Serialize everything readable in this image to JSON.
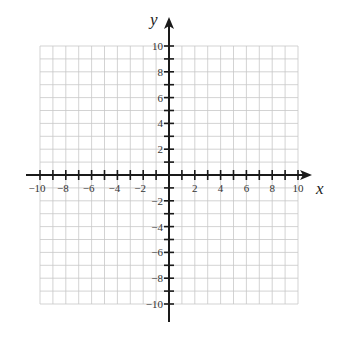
{
  "graph": {
    "title": "Coordinate plane",
    "x_axis": {
      "label": "x",
      "min": -10,
      "max": 10,
      "tick_step": 1,
      "label_step": 2
    },
    "y_axis": {
      "label": "y",
      "min": -10,
      "max": 10,
      "tick_step": 1,
      "label_step": 2
    },
    "x_tick_labels": [
      "-10",
      "-8",
      "-6",
      "-4",
      "-2",
      "2",
      "4",
      "6",
      "8",
      "10"
    ],
    "y_tick_labels": [
      "10",
      "8",
      "6",
      "4",
      "2",
      "-2",
      "-4",
      "-6",
      "-8",
      "-10"
    ],
    "colors": {
      "grid": "#c8c8c8",
      "axis": "#1a1a1a",
      "background": "#ffffff"
    }
  }
}
